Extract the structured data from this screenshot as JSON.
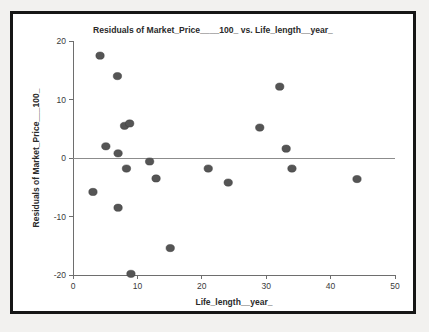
{
  "chart_data": {
    "type": "scatter",
    "title": "Residuals of Market_Price____100_ vs. Life_length__year_",
    "xlabel": "Life_length__year_",
    "ylabel": "Residuals of Market_Price___100_",
    "xlim": [
      0,
      50
    ],
    "ylim": [
      -20,
      20
    ],
    "xticks": [
      0,
      10,
      20,
      30,
      40,
      50
    ],
    "yticks": [
      20,
      10,
      0,
      -10,
      -20
    ],
    "xtick_labels": [
      "0",
      "10",
      "20",
      "30",
      "40",
      "50"
    ],
    "ytick_labels": [
      "20",
      "10",
      "0",
      "-10",
      "-20"
    ],
    "grid": false,
    "legend": null,
    "reference_line": {
      "y": 0,
      "color": "#8c8c8c"
    },
    "marker": {
      "shape": "circle",
      "color": "#555555",
      "size": 4.2
    },
    "points": [
      {
        "x": 4.2,
        "y": 17.5
      },
      {
        "x": 6.9,
        "y": 14.0
      },
      {
        "x": 5.1,
        "y": 2.0
      },
      {
        "x": 7.0,
        "y": 0.8
      },
      {
        "x": 8.0,
        "y": 5.5
      },
      {
        "x": 8.8,
        "y": 5.9
      },
      {
        "x": 8.3,
        "y": -1.8
      },
      {
        "x": 3.1,
        "y": -5.8
      },
      {
        "x": 7.0,
        "y": -8.5
      },
      {
        "x": 9.0,
        "y": -19.8
      },
      {
        "x": 11.9,
        "y": -0.6
      },
      {
        "x": 12.9,
        "y": -3.5
      },
      {
        "x": 15.1,
        "y": -15.4
      },
      {
        "x": 21.0,
        "y": -1.8
      },
      {
        "x": 24.1,
        "y": -4.2
      },
      {
        "x": 29.0,
        "y": 5.2
      },
      {
        "x": 32.1,
        "y": 12.2
      },
      {
        "x": 33.1,
        "y": 1.6
      },
      {
        "x": 34.0,
        "y": -1.8
      },
      {
        "x": 44.1,
        "y": -3.6
      }
    ]
  },
  "colors": {
    "frame": "#161616",
    "background": "#f2f1ef",
    "plot_background": "#ffffff",
    "marker": "#555555",
    "axis": "#6e6e6e"
  }
}
